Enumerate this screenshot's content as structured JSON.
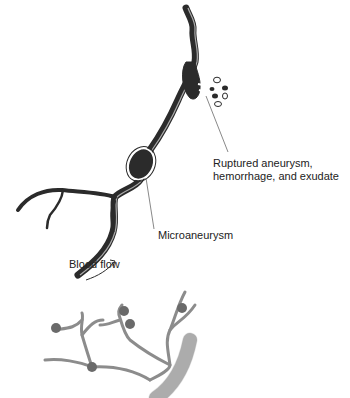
{
  "diagram": {
    "top_figure": {
      "labels": {
        "ruptured": [
          "Ruptured aneurysm,",
          "hemorrhage, and exudate"
        ],
        "microaneurysm": "Microaneurysm",
        "blood_flow": "Blood flow"
      }
    },
    "bottom_figure": {
      "description": "capillary network with microaneurysms branching from larger vessel"
    },
    "colors": {
      "vessel_dark": "#2b2b2b",
      "vessel_outline": "#ffffff",
      "capillary_gray": "#8c8c8c",
      "aneurysm_dot": "#6a6a6a",
      "large_vessel": "#b8b8b8",
      "text": "#222222"
    }
  }
}
